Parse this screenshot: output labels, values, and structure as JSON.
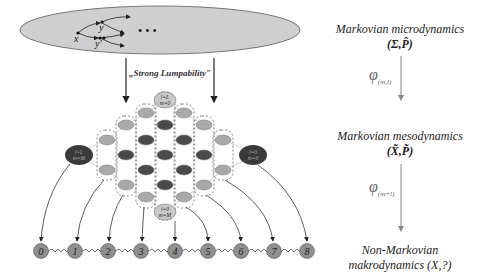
{
  "micro_graph": {
    "nodes": [
      "x",
      "y",
      "y'"
    ],
    "ellipsis": "• • •"
  },
  "lumpability_label": "„Strong Lumpability\"",
  "lattice": {
    "top_node": {
      "line1": "l=L",
      "line2": "m=0"
    },
    "bottom_node": {
      "line1": "l=0",
      "line2": "m=M"
    },
    "left_node": {
      "line1": "l=L",
      "line2": "m=M"
    },
    "right_node": {
      "line1": "l=0",
      "line2": "m=0"
    },
    "colors": {
      "light": "#a9a9a9",
      "dark": "#4a4a4a",
      "side": "#3a3a3a"
    }
  },
  "chain": {
    "nodes": [
      "0",
      "1",
      "2",
      "3",
      "4",
      "5",
      "6",
      "7",
      "8"
    ],
    "node_color": "#8f8f8f"
  },
  "hierarchy": {
    "micro": {
      "title": "Markovian microdynamics",
      "symbol": "(Σ,P̂)"
    },
    "phi1": {
      "symbol": "φ",
      "subscript": "(m,l)"
    },
    "meso": {
      "title": "Markovian mesodynamics",
      "symbol": "(X̃,P̃)"
    },
    "phi2": {
      "symbol": "φ",
      "subscript": "(m+l)"
    },
    "macro": {
      "title_line1": "Non-Markovian",
      "title_line2": "makrodynamics (X,?)"
    }
  }
}
